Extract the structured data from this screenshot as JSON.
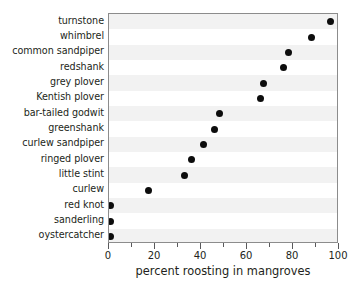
{
  "chart_data": {
    "type": "scatter",
    "subtype": "cleveland-dot-plot",
    "title": "",
    "xlabel": "percent roosting in mangroves",
    "ylabel": "",
    "xlim": [
      0,
      100
    ],
    "xticks": [
      0,
      20,
      40,
      60,
      80,
      100
    ],
    "xtick_labels": [
      "0",
      "20",
      "40",
      "60",
      "80",
      "100"
    ],
    "xminorticks": [
      10,
      30,
      50,
      70,
      90
    ],
    "grid": false,
    "legend": null,
    "orientation": "horizontal",
    "row_banding": true,
    "band_color": "#f2f2f2",
    "marker_color": "#0d0d0d",
    "frame_color": "#8c8c8c",
    "categories": [
      "turnstone",
      "whimbrel",
      "common sandpiper",
      "redshank",
      "grey plover",
      "Kentish plover",
      "bar-tailed godwit",
      "greenshank",
      "curlew sandpiper",
      "ringed plover",
      "little stint",
      "curlew",
      "red knot",
      "sanderling",
      "oystercatcher"
    ],
    "values": [
      96.5,
      88,
      78,
      76,
      67,
      66,
      48,
      46,
      41,
      36,
      33,
      17,
      0.5,
      0.5,
      0.5
    ]
  }
}
